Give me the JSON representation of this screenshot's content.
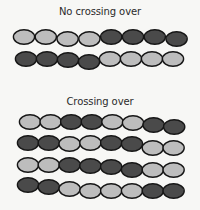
{
  "colors": {
    "light": "#bdbdbd",
    "dark": "#4a4a4a",
    "outline": "#161616",
    "background": "#f7f7f5",
    "text": "#2a2a2a"
  },
  "sections": [
    {
      "title": "No crossing over",
      "title_y": 6,
      "chromosomes": [
        {
          "y": 37,
          "x0": 24,
          "step": 21.8,
          "wave": [
            0,
            0,
            2,
            2,
            0,
            0,
            0,
            2
          ],
          "sequence": [
            "light",
            "light",
            "light",
            "light",
            "dark",
            "dark",
            "dark",
            "dark"
          ]
        },
        {
          "y": 59,
          "x0": 26,
          "step": 21.0,
          "wave": [
            0,
            0,
            1,
            3,
            0,
            0,
            0,
            0
          ],
          "sequence": [
            "dark",
            "dark",
            "dark",
            "dark",
            "light",
            "light",
            "light",
            "light"
          ]
        }
      ]
    },
    {
      "title": "Crossing over",
      "title_y": 96,
      "chromosomes": [
        {
          "y": 122,
          "x0": 30,
          "step": 20.6,
          "wave": [
            0,
            0,
            0,
            0,
            0,
            1,
            3,
            5
          ],
          "sequence": [
            "light",
            "light",
            "dark",
            "dark",
            "light",
            "light",
            "dark",
            "dark"
          ]
        },
        {
          "y": 143,
          "x0": 28,
          "step": 20.8,
          "wave": [
            0,
            0,
            1,
            0,
            0,
            1,
            5,
            5
          ],
          "sequence": [
            "dark",
            "dark",
            "light",
            "light",
            "dark",
            "dark",
            "light",
            "light"
          ]
        },
        {
          "y": 165,
          "x0": 28,
          "step": 20.8,
          "wave": [
            0,
            0,
            0,
            1,
            2,
            5,
            5,
            5
          ],
          "sequence": [
            "light",
            "light",
            "dark",
            "dark",
            "dark",
            "dark",
            "light",
            "light"
          ]
        },
        {
          "y": 185,
          "x0": 28,
          "step": 20.8,
          "wave": [
            0,
            2,
            4,
            6,
            6,
            6,
            6,
            6
          ],
          "sequence": [
            "dark",
            "dark",
            "light",
            "light",
            "light",
            "light",
            "dark",
            "dark"
          ]
        }
      ]
    }
  ]
}
